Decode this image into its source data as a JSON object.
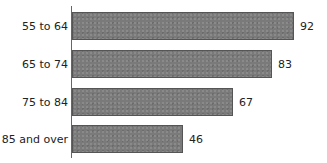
{
  "chart_data": {
    "type": "bar",
    "orientation": "horizontal",
    "title": "",
    "xlabel": "",
    "ylabel": "",
    "categories": [
      "55 to 64",
      "65 to 74",
      "75 to 84",
      "85 and over"
    ],
    "values": [
      92,
      83,
      67,
      46
    ],
    "data_labels": [
      "92",
      "83",
      "67",
      "46"
    ],
    "grid": false,
    "legend": null,
    "bar_color": "#7a7a7a"
  }
}
